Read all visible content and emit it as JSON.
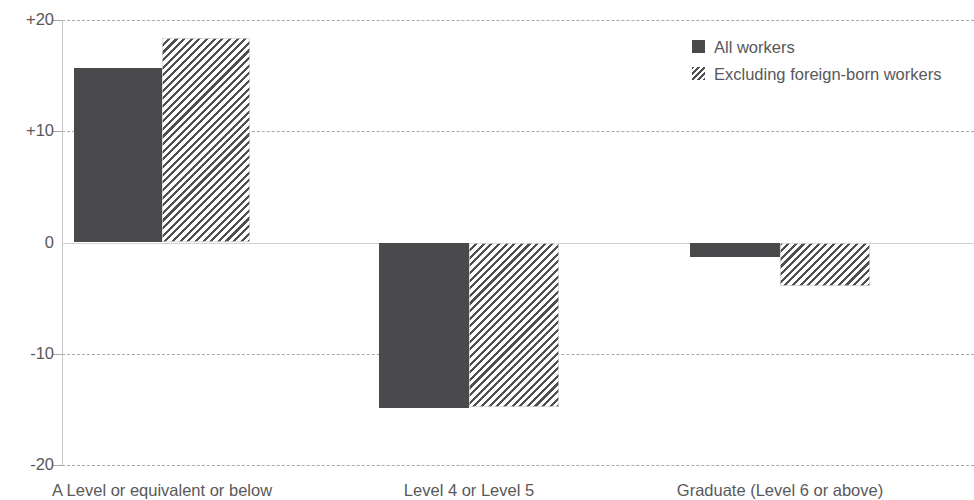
{
  "chart_data": {
    "type": "bar",
    "title": "",
    "subtitle": "",
    "xlabel": "",
    "ylabel": "",
    "categories": [
      "A Level or equivalent or below",
      "Level 4 or Level 5",
      "Graduate (Level 6 or above)"
    ],
    "series": [
      {
        "name": "All workers",
        "values": [
          15.7,
          -14.9,
          -1.3
        ],
        "style": "solid",
        "color": "#4a4a4c"
      },
      {
        "name": "Excluding foreign-born workers",
        "values": [
          18.4,
          -14.8,
          -3.9
        ],
        "style": "diagonal-hatch",
        "color": "#4f4f51"
      }
    ],
    "ylim": [
      -20,
      20
    ],
    "yticks": [
      20,
      10,
      0,
      -10,
      -20
    ],
    "ytick_labels": [
      "+20",
      "+10",
      "0",
      "-10",
      "-20"
    ],
    "grid": true,
    "grid_style": "dashed-horizontal",
    "zero_line": true,
    "legend_position": "top-right",
    "legend": [
      "All workers",
      "Excluding foreign-born workers"
    ]
  },
  "axis": {
    "y": {
      "ticks": [
        {
          "label": "+20",
          "value": 20
        },
        {
          "label": "+10",
          "value": 10
        },
        {
          "label": "0",
          "value": 0
        },
        {
          "label": "-10",
          "value": -10
        },
        {
          "label": "-20",
          "value": -20
        }
      ]
    },
    "x": {
      "categories": [
        {
          "label": "A Level or equivalent or below"
        },
        {
          "label": "Level 4 or Level 5"
        },
        {
          "label": "Graduate (Level 6 or above)"
        }
      ]
    }
  },
  "legend": {
    "items": [
      {
        "label": "All workers",
        "swatch": "solid-swatch-icon"
      },
      {
        "label": "Excluding foreign-born workers",
        "swatch": "hatched-swatch-icon"
      }
    ]
  }
}
